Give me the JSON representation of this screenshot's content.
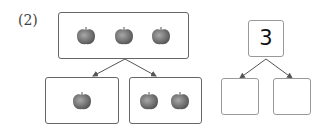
{
  "problem_label": "(2)",
  "left_diagram": {
    "top_box": {
      "apples": 3
    },
    "bottom_left_box": {
      "apples": 1
    },
    "bottom_right_box": {
      "apples": 2
    }
  },
  "right_diagram": {
    "top_number": "3",
    "bottom_left": "",
    "bottom_right": ""
  },
  "colors": {
    "apple": "#7a7a7a",
    "border": "#666666"
  }
}
